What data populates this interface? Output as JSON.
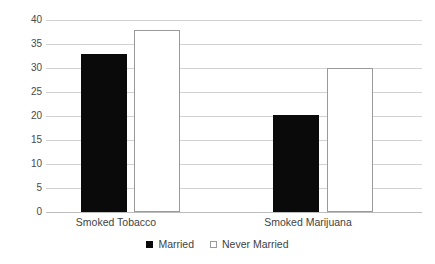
{
  "chart_data": {
    "type": "bar",
    "title": "",
    "subtitle": "",
    "xlabel": "",
    "ylabel": "",
    "categories": [
      "Smoked Tobacco",
      "Smoked Marijuana"
    ],
    "series": [
      {
        "name": "Married",
        "color": "#0a0a0a",
        "values": [
          33,
          20.2
        ]
      },
      {
        "name": "Never Married",
        "color": "#ffffff",
        "values": [
          38,
          30
        ]
      }
    ],
    "ylim": [
      0,
      40
    ],
    "ytick_values": [
      0,
      5,
      10,
      15,
      20,
      25,
      30,
      35,
      40
    ],
    "ytick_labels": [
      "0",
      "5",
      "10",
      "15",
      "20",
      "25",
      "30",
      "35",
      "40"
    ],
    "grid": true,
    "grid_axis": "y",
    "legend": {
      "position": "bottom",
      "entries": [
        {
          "label": "Married",
          "marker": "filled-square"
        },
        {
          "label": "Never Married",
          "marker": "hollow-square"
        }
      ]
    }
  }
}
